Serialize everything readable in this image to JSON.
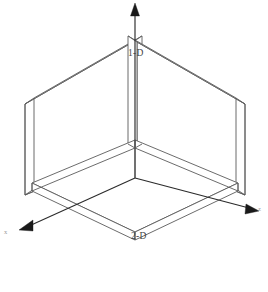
{
  "diagram": {
    "background_color": "#ffffff",
    "line_color": "#5a5a5a",
    "axis_color": "#2b2b2b",
    "labels": {
      "one_d": "1-D",
      "two_d": "2-D",
      "axis_x": "x",
      "axis_z": "z",
      "axis_y": "y"
    },
    "elements": {
      "left_plane_name": "left-vertical-slab",
      "right_plane_name": "right-vertical-slab",
      "floor_plane_name": "horizontal-floor-slab",
      "vertical_axis_name": "vertical-axis-arrow",
      "left_axis_name": "left-axis-arrow",
      "right_axis_name": "right-axis-arrow"
    }
  }
}
